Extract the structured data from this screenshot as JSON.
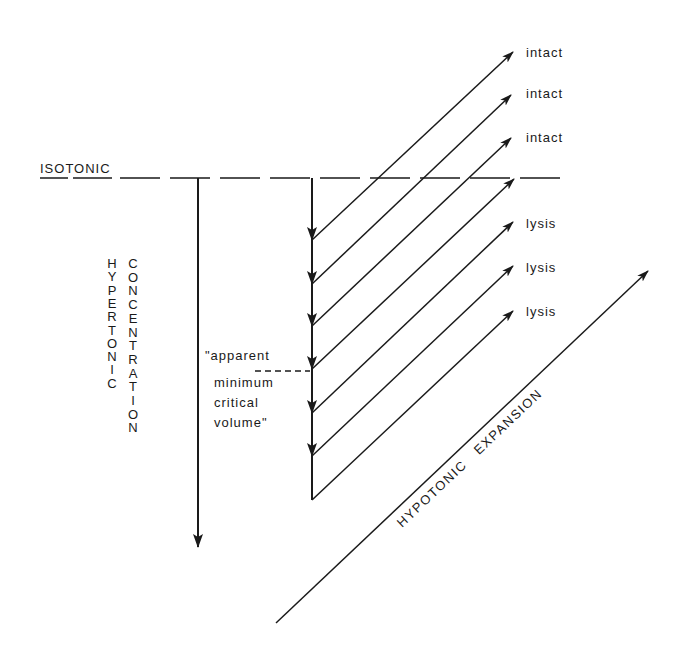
{
  "diagram": {
    "type": "osmotic-volume-response-diagram",
    "labels": {
      "isotonic": "ISOTONIC",
      "hypertonic_column": "HYPERTONIC",
      "concentration_column": "CONCENTRATION",
      "critical_volume_lines": [
        "\"apparent",
        "minimum",
        "critical",
        "volume\""
      ],
      "hypotonic_expansion": "HYPOTONIC   EXPANSION"
    },
    "outcomes": [
      {
        "label": "intact",
        "tip": [
          513,
          52
        ]
      },
      {
        "label": "intact",
        "tip": [
          511,
          95
        ]
      },
      {
        "label": "intact",
        "tip": [
          511,
          138
        ]
      },
      {
        "label": "",
        "tip": [
          514,
          179
        ]
      },
      {
        "label": "lysis",
        "tip": [
          513,
          222
        ]
      },
      {
        "label": "lysis",
        "tip": [
          513,
          266
        ]
      },
      {
        "label": "lysis",
        "tip": [
          513,
          311
        ]
      }
    ],
    "vertical_stages_y": [
      240,
      284,
      326,
      369,
      413,
      456,
      500
    ],
    "isotonic_line": {
      "y": 178,
      "x_start": 120,
      "x_end": 570
    },
    "colors": {
      "ink": "#1a1a1a",
      "background": "#ffffff"
    }
  }
}
